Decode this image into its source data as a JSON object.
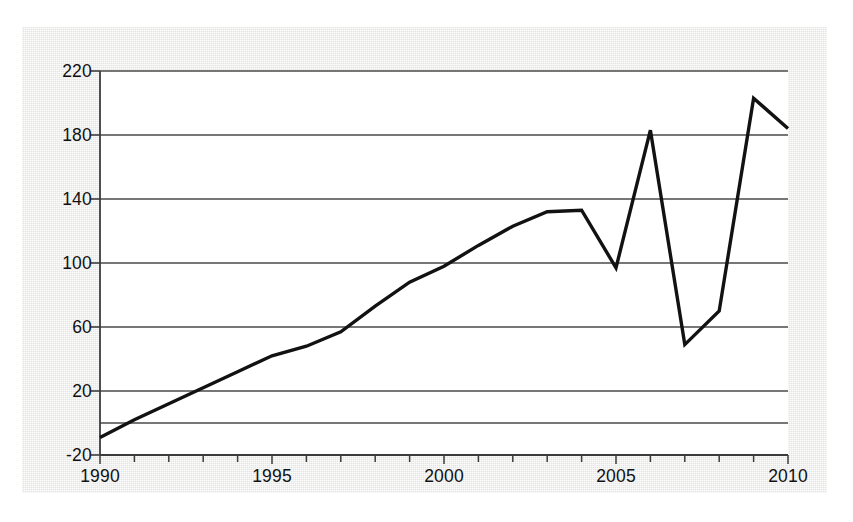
{
  "figure": {
    "background_color": "#ececeb",
    "plot_background_color": "#ffffff",
    "line_color": "#121212",
    "grid_color": "#4a4a4a",
    "axis_color": "#3c3c3c"
  },
  "chart_data": {
    "type": "line",
    "title": "",
    "xlabel": "",
    "ylabel": "",
    "xlim": [
      1990,
      2010
    ],
    "ylim": [
      -20,
      220
    ],
    "grid": true,
    "legend": false,
    "y_ticks": [
      220,
      180,
      140,
      100,
      60,
      20,
      -20
    ],
    "y_tick_labels": [
      "220",
      "180",
      "140",
      "100",
      "60",
      "20",
      "-20"
    ],
    "x_ticks": [
      1990,
      1995,
      2000,
      2005,
      2010
    ],
    "x_tick_labels": [
      "1990",
      "1995",
      "2000",
      "2005",
      "2010"
    ],
    "x_minor_tick_interval": 1,
    "series": [
      {
        "name": "series-1",
        "x": [
          1990,
          1991,
          1992,
          1993,
          1994,
          1995,
          1996,
          1997,
          1998,
          1999,
          2000,
          2001,
          2002,
          2003,
          2004,
          2005,
          2006,
          2007,
          2008,
          2009,
          2010
        ],
        "values": [
          -9,
          2,
          12,
          22,
          32,
          42,
          48,
          57,
          73,
          88,
          98,
          111,
          123,
          132,
          133,
          97,
          183,
          49,
          70,
          203,
          184
        ]
      }
    ]
  }
}
